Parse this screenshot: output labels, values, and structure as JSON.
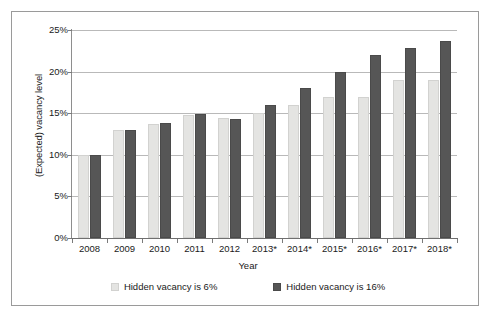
{
  "chart_data": {
    "type": "bar",
    "title": "",
    "xlabel": "Year",
    "ylabel": "(Expected) vacancy level",
    "categories": [
      "2008",
      "2009",
      "2010",
      "2011",
      "2012",
      "2013*",
      "2014*",
      "2015*",
      "2016*",
      "2017*",
      "2018*"
    ],
    "series": [
      {
        "name": "Hidden vacancy is 6%",
        "color": "#e4e4e2",
        "values": [
          10.0,
          13.0,
          13.7,
          14.8,
          14.4,
          15.0,
          16.0,
          17.0,
          17.0,
          19.0,
          19.0
        ]
      },
      {
        "name": "Hidden vacancy is 16%",
        "color": "#565656",
        "values": [
          10.0,
          13.0,
          13.8,
          14.9,
          14.3,
          16.0,
          18.0,
          20.0,
          22.0,
          22.8,
          23.7
        ]
      }
    ],
    "ylim": [
      0,
      25
    ],
    "yticks": [
      0,
      5,
      10,
      15,
      20,
      25
    ],
    "ytick_labels": [
      "0%",
      "5%",
      "10%",
      "15%",
      "20%",
      "25%"
    ],
    "grid": true,
    "grid_axis": "y",
    "legend_position": "bottom",
    "value_unit": "%"
  },
  "axes": {
    "y_title": "(Expected) vacancy level",
    "x_title": "Year"
  },
  "legend": {
    "entries": [
      {
        "label": "Hidden vacancy is 6%",
        "swatch": "light-gray-swatch"
      },
      {
        "label": "Hidden vacancy is 16%",
        "swatch": "dark-gray-swatch"
      }
    ]
  }
}
